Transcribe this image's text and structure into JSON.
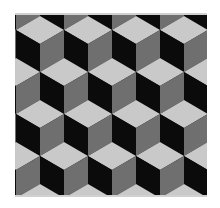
{
  "image": {
    "description": "Tumbling blocks optical illusion: isometric cubes with light top, black left and gray right faces",
    "colors": {
      "top_face": "#c9c9c9",
      "left_face": "#0b0b0b",
      "right_face": "#6f6f6f",
      "border": "#d0d0d0"
    },
    "geometry": {
      "cube_width": 48,
      "half_height": 14,
      "side_height": 28,
      "columns": 5,
      "rows": 6,
      "origin_x": 25,
      "origin_y": 3
    }
  }
}
